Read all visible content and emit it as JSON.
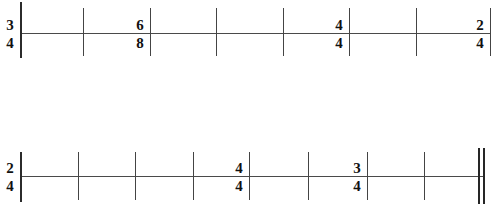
{
  "worksheet": {
    "title": "Rhythm staff worksheet",
    "background_color": "#ffffff",
    "line_color": "#4a4a4a",
    "ink_color": "#111111"
  },
  "staves": [
    {
      "name": "upper-staff",
      "line": {
        "x": 20,
        "y": 33,
        "width": 470
      },
      "barlines": [
        {
          "x": 20,
          "y": 2,
          "height": 56,
          "type": "single",
          "heavy": true
        },
        {
          "x": 83,
          "y": 8,
          "height": 48,
          "type": "single",
          "heavy": false
        },
        {
          "x": 150,
          "y": 8,
          "height": 48,
          "type": "single",
          "heavy": false
        },
        {
          "x": 216,
          "y": 8,
          "height": 48,
          "type": "single",
          "heavy": false
        },
        {
          "x": 283,
          "y": 8,
          "height": 48,
          "type": "single",
          "heavy": false
        },
        {
          "x": 349,
          "y": 8,
          "height": 48,
          "type": "single",
          "heavy": false
        },
        {
          "x": 416,
          "y": 8,
          "height": 48,
          "type": "single",
          "heavy": false
        },
        {
          "x": 490,
          "y": 8,
          "height": 48,
          "type": "single",
          "heavy": false
        }
      ],
      "time_signatures": [
        {
          "numerator": "3",
          "denominator": "4",
          "x": 2,
          "y": 18
        },
        {
          "numerator": "6",
          "denominator": "8",
          "x": 132,
          "y": 18
        },
        {
          "numerator": "4",
          "denominator": "4",
          "x": 331,
          "y": 18
        },
        {
          "numerator": "2",
          "denominator": "4",
          "x": 472,
          "y": 18
        }
      ]
    },
    {
      "name": "lower-staff",
      "line": {
        "x": 20,
        "y": 176,
        "width": 464
      },
      "barlines": [
        {
          "x": 20,
          "y": 152,
          "height": 50,
          "type": "single",
          "heavy": true
        },
        {
          "x": 78,
          "y": 152,
          "height": 48,
          "type": "single",
          "heavy": false
        },
        {
          "x": 135,
          "y": 152,
          "height": 48,
          "type": "single",
          "heavy": false
        },
        {
          "x": 193,
          "y": 152,
          "height": 48,
          "type": "single",
          "heavy": false
        },
        {
          "x": 249,
          "y": 152,
          "height": 48,
          "type": "single",
          "heavy": false
        },
        {
          "x": 308,
          "y": 152,
          "height": 48,
          "type": "single",
          "heavy": false
        },
        {
          "x": 367,
          "y": 152,
          "height": 48,
          "type": "single",
          "heavy": false
        },
        {
          "x": 424,
          "y": 152,
          "height": 48,
          "type": "single",
          "heavy": false
        }
      ],
      "final_barline": {
        "x": 478,
        "y": 148,
        "height": 56,
        "type": "double"
      },
      "time_signatures": [
        {
          "numerator": "2",
          "denominator": "4",
          "x": 2,
          "y": 161
        },
        {
          "numerator": "4",
          "denominator": "4",
          "x": 231,
          "y": 161
        },
        {
          "numerator": "3",
          "denominator": "4",
          "x": 349,
          "y": 161
        }
      ]
    }
  ]
}
